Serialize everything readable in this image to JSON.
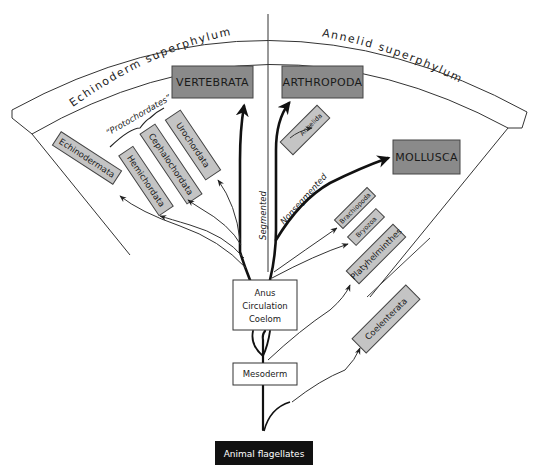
{
  "diagram": {
    "superphyla": {
      "left": "Echinoderm superphylum",
      "right": "Annelid superphylum"
    },
    "top_groups": {
      "vertebrata": "VERTEBRATA",
      "arthropoda": "ARTHROPODA",
      "mollusca": "MOLLUSCA"
    },
    "phyla": {
      "echinodermata": "Echinodermata",
      "hemichordata": "Hemichordata",
      "cephalochordata": "Cephalochordata",
      "urochordata": "Urochordata",
      "annelida": "Annelida",
      "brachiopoda": "Brachiopoda",
      "bryozoa": "Bryozoa",
      "platyhelminthes": "Platyhelminthes",
      "coelenterata": "Coelenterata"
    },
    "group_brace": "“Protochordates”",
    "branch_labels": {
      "segmented": "Segmented",
      "nonsegmented": "Nonsegmented"
    },
    "nodes": {
      "anus_circulation_coelom": [
        "Anus",
        "Circulation",
        "Coelom"
      ],
      "mesoderm": "Mesoderm",
      "root": "Animal flagellates"
    },
    "colors": {
      "major_box_fill": "#8a8a8a",
      "minor_box_fill": "#c4c4c4",
      "root_fill": "#111111",
      "line": "#222222"
    }
  }
}
